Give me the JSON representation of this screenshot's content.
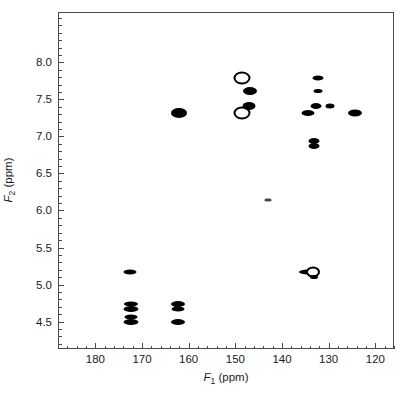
{
  "figure": {
    "kind": "nmr-2d-correlation-spectrum",
    "background_color": "#ffffff",
    "frame_color": "#4a4a4a",
    "peak_color": "#000000"
  },
  "axes": {
    "x": {
      "title_var": "F",
      "title_sub": "1",
      "title_unit": "(ppm)",
      "title_full": "F1 (ppm)",
      "min": 116.0,
      "max": 188.0,
      "inverted": true,
      "major_ticks": [
        180,
        170,
        160,
        150,
        140,
        130,
        120
      ],
      "major_tick_labels": [
        "180",
        "170",
        "160",
        "150",
        "140",
        "130",
        "120"
      ],
      "minor_tick_step": 2
    },
    "y": {
      "title_var": "F",
      "title_sub": "2",
      "title_unit": "(ppm)",
      "title_full": "F2 (ppm)",
      "min": 4.13,
      "max": 8.68,
      "inverted": true,
      "major_ticks": [
        4.5,
        5.0,
        5.5,
        6.0,
        6.5,
        7.0,
        7.5,
        8.0
      ],
      "major_tick_labels": [
        "4.5",
        "5.0",
        "5.5",
        "6.0",
        "6.5",
        "7.0",
        "7.5",
        "8.0"
      ],
      "minor_tick_step": 0.1
    }
  },
  "chart_data": {
    "type": "scatter",
    "title": "",
    "xlabel": "F1 (ppm)",
    "ylabel": "F2 (ppm)",
    "xlim": [
      188.0,
      116.0
    ],
    "ylim": [
      8.68,
      4.13
    ],
    "grid": false,
    "legend": "none",
    "x_unit": "ppm",
    "y_unit": "ppm",
    "points": [
      {
        "id": "p01",
        "f1": 172.6,
        "f2": 4.51,
        "w": 15,
        "h": 6,
        "style": "filled"
      },
      {
        "id": "p02",
        "f1": 172.6,
        "f2": 4.57,
        "w": 13,
        "h": 5,
        "style": "filled"
      },
      {
        "id": "p03",
        "f1": 172.6,
        "f2": 4.69,
        "w": 15,
        "h": 6,
        "style": "filled"
      },
      {
        "id": "p04",
        "f1": 172.6,
        "f2": 4.75,
        "w": 14,
        "h": 5,
        "style": "filled"
      },
      {
        "id": "p05",
        "f1": 172.7,
        "f2": 5.18,
        "w": 13,
        "h": 5,
        "style": "filled"
      },
      {
        "id": "p06",
        "f1": 162.4,
        "f2": 4.51,
        "w": 14,
        "h": 6,
        "style": "filled"
      },
      {
        "id": "p07",
        "f1": 162.4,
        "f2": 4.69,
        "w": 13,
        "h": 5,
        "style": "filled"
      },
      {
        "id": "p08",
        "f1": 162.4,
        "f2": 4.75,
        "w": 14,
        "h": 6,
        "style": "filled"
      },
      {
        "id": "p09",
        "f1": 163.0,
        "f2": 4.72,
        "w": 4,
        "h": 3,
        "style": "faint"
      },
      {
        "id": "p10",
        "f1": 162.2,
        "f2": 7.33,
        "w": 16,
        "h": 10,
        "style": "filled"
      },
      {
        "id": "p11",
        "f1": 148.8,
        "f2": 7.33,
        "w": 13,
        "h": 9,
        "style": "ring"
      },
      {
        "id": "p12",
        "f1": 147.2,
        "f2": 7.43,
        "w": 13,
        "h": 8,
        "style": "filled"
      },
      {
        "id": "p13",
        "f1": 147.0,
        "f2": 7.63,
        "w": 14,
        "h": 8,
        "style": "filled"
      },
      {
        "id": "p14",
        "f1": 148.8,
        "f2": 7.8,
        "w": 13,
        "h": 9,
        "style": "ring2"
      },
      {
        "id": "p15",
        "f1": 143.3,
        "f2": 6.15,
        "w": 7,
        "h": 3,
        "style": "faint"
      },
      {
        "id": "p16",
        "f1": 134.7,
        "f2": 5.18,
        "w": 18,
        "h": 5,
        "style": "filled"
      },
      {
        "id": "p17",
        "f1": 133.6,
        "f2": 5.18,
        "w": 10,
        "h": 7,
        "style": "ring2"
      },
      {
        "id": "p18",
        "f1": 133.4,
        "f2": 5.11,
        "w": 8,
        "h": 4,
        "style": "filled"
      },
      {
        "id": "p19",
        "f1": 133.3,
        "f2": 6.88,
        "w": 11,
        "h": 6,
        "style": "filled"
      },
      {
        "id": "p20",
        "f1": 133.3,
        "f2": 6.95,
        "w": 11,
        "h": 6,
        "style": "filled"
      },
      {
        "id": "p21",
        "f1": 134.7,
        "f2": 7.33,
        "w": 13,
        "h": 6,
        "style": "filled"
      },
      {
        "id": "p22",
        "f1": 133.0,
        "f2": 7.43,
        "w": 11,
        "h": 6,
        "style": "filled"
      },
      {
        "id": "p23",
        "f1": 132.6,
        "f2": 7.63,
        "w": 9,
        "h": 4,
        "style": "filled"
      },
      {
        "id": "p24",
        "f1": 132.5,
        "f2": 7.8,
        "w": 11,
        "h": 5,
        "style": "filled"
      },
      {
        "id": "p25",
        "f1": 130.0,
        "f2": 7.43,
        "w": 9,
        "h": 5,
        "style": "filled"
      },
      {
        "id": "p26",
        "f1": 124.5,
        "f2": 7.33,
        "w": 14,
        "h": 7,
        "style": "filled"
      }
    ]
  }
}
